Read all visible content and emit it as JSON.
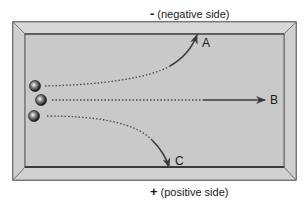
{
  "diagram": {
    "top_label": {
      "sign": "-",
      "text": "(negative side)"
    },
    "bottom_label": {
      "sign": "+",
      "text": "(positive side)"
    },
    "paths": [
      {
        "id": "A",
        "label": "A",
        "direction": "deflects toward negative side (up)"
      },
      {
        "id": "B",
        "label": "B",
        "direction": "straight, undeflected"
      },
      {
        "id": "C",
        "label": "C",
        "direction": "deflects toward positive side (down)"
      }
    ],
    "particles": 3,
    "colors": {
      "frame_outer": "#d0d0d0",
      "panel": "#c9c9c9",
      "bevel": "#bdbdbd",
      "line": "#333333",
      "arrow": "#3a3a3a"
    }
  }
}
